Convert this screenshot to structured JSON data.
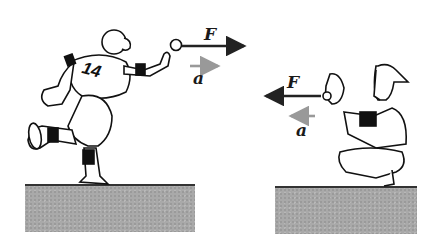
{
  "figure": {
    "left_scene": {
      "subject": "pitcher",
      "jersey_number": "14",
      "force_label": "F",
      "acceleration_label": "a",
      "force_direction": "right",
      "acceleration_direction": "right"
    },
    "right_scene": {
      "subject": "catcher",
      "force_label": "F",
      "acceleration_label": "a",
      "force_direction": "left",
      "acceleration_direction": "left"
    },
    "colors": {
      "force_arrow": "#222222",
      "acceleration_arrow": "#999999",
      "ground": "#a9a9a9"
    }
  }
}
